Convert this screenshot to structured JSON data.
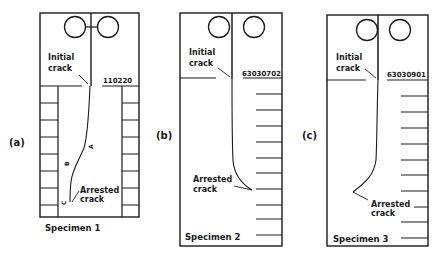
{
  "figure": {
    "panels": [
      {
        "id": "a",
        "panel_label": "(a)",
        "specimen_label": "Specimen 1",
        "code": "110220",
        "initial_crack_line1": "Initial",
        "initial_crack_line2": "crack",
        "arrested_crack_line1": "Arrested",
        "arrested_crack_line2": "crack",
        "path_markers": [
          "A",
          "B",
          "C"
        ],
        "grid": "double-sided cell strips"
      },
      {
        "id": "b",
        "panel_label": "(b)",
        "specimen_label": "Specimen 2",
        "code": "63030702",
        "initial_crack_line1": "Initial",
        "initial_crack_line2": "crack",
        "arrested_crack_line1": "Arrested",
        "arrested_crack_line2": "crack",
        "grid": "right-side tick marks"
      },
      {
        "id": "c",
        "panel_label": "(c)",
        "specimen_label": "Specimen 3",
        "code": "63030901",
        "initial_crack_line1": "Initial",
        "initial_crack_line2": "crack",
        "arrested_crack_line1": "Arrested",
        "arrested_crack_line2": "crack",
        "grid": "right-side tick marks"
      }
    ],
    "colors": {
      "ink": "#1a1a1a",
      "background": "#ffffff"
    }
  }
}
